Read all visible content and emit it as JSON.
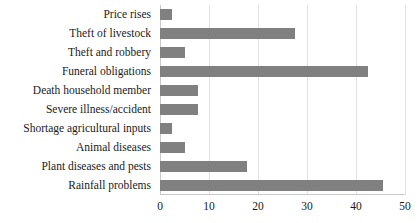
{
  "chart_data": {
    "type": "bar",
    "orientation": "horizontal",
    "title": "",
    "subtitle": "",
    "xlabel": "",
    "ylabel": "",
    "xlim": [
      0,
      50
    ],
    "xticks": [
      "0",
      "10",
      "20",
      "30",
      "40",
      "50"
    ],
    "xtick_values": [
      0,
      10,
      20,
      30,
      40,
      50
    ],
    "grid": "vertical",
    "legend": "none",
    "bar_color": "#808080",
    "grid_color": "#e2e2e2",
    "axis_color": "#c9c9c9",
    "text_color": "#1a1a1a",
    "categories": [
      "Price rises",
      "Theft of livestock",
      "Theft and robbery",
      "Funeral obligations",
      "Death household member",
      "Severe illness/accident",
      "Shortage agricultural inputs",
      "Animal diseases",
      "Plant diseases and pests",
      "Rainfall problems"
    ],
    "values": [
      2.5,
      27.5,
      5.2,
      42.5,
      7.7,
      7.7,
      2.5,
      5.2,
      17.8,
      45.5
    ]
  }
}
